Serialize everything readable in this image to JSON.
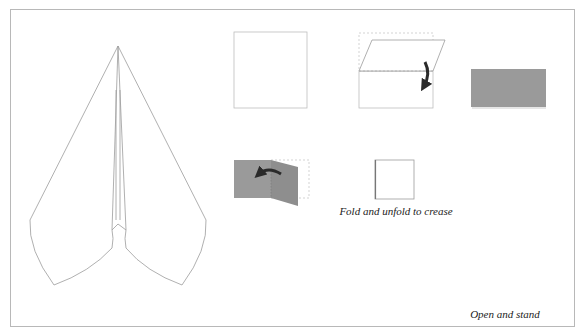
{
  "colors": {
    "paper_gray": "#9a9a9a",
    "line": "#9c9c9c",
    "arrow": "#2a2a2a",
    "frame": "#b8b8b8"
  },
  "steps": [
    {
      "id": 1,
      "description": "square sheet"
    },
    {
      "id": 2,
      "description": "fold top half down",
      "arrow": "down"
    },
    {
      "id": 3,
      "description": "folded rectangle (gray side)"
    },
    {
      "id": 4,
      "description": "fold right flap left",
      "arrow": "left"
    },
    {
      "id": 5,
      "description": "square",
      "caption": "Fold and unfold to crease"
    },
    {
      "id": 6,
      "description": "fold flap right",
      "arrow": "right"
    },
    {
      "id": 7,
      "description": "fold both top corners to center",
      "arrows": [
        "down-right",
        "down-left"
      ]
    },
    {
      "id": 8,
      "description": "triangle"
    },
    {
      "id": 9,
      "description": "opened shape",
      "caption": "Open and stand"
    }
  ],
  "captions": {
    "fold_unfold": "Fold and unfold to crease",
    "open_stand": "Open and stand"
  },
  "final_model": "paper plane / arrowhead shape"
}
